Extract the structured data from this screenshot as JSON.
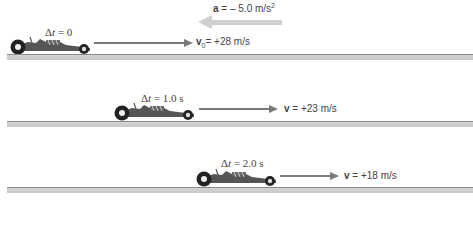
{
  "acceleration": {
    "symbol": "a",
    "equals": " = – 5.0 m/s",
    "exponent": "2",
    "direction": "left",
    "color": "#cfcfcf"
  },
  "snapshots": [
    {
      "dt_prefix": "Δ",
      "dt_var": "t",
      "dt_value": " = 0",
      "velocity_symbol": "v",
      "velocity_subscript": "0",
      "velocity_value": "= +28 m/s"
    },
    {
      "dt_prefix": "Δ",
      "dt_var": "t",
      "dt_value": " = 1.0 s",
      "velocity_symbol": "v",
      "velocity_subscript": "",
      "velocity_value": " = +23 m/s"
    },
    {
      "dt_prefix": "Δ",
      "dt_var": "t",
      "dt_value": " = 2.0 s",
      "velocity_symbol": "v",
      "velocity_subscript": "",
      "velocity_value": " = +18 m/s"
    }
  ],
  "colors": {
    "arrow": "#7a7a7a",
    "ground_top": "#8a8a8a",
    "ground_fill": "#d0d0d0",
    "car_body": "#3a3a3a"
  }
}
